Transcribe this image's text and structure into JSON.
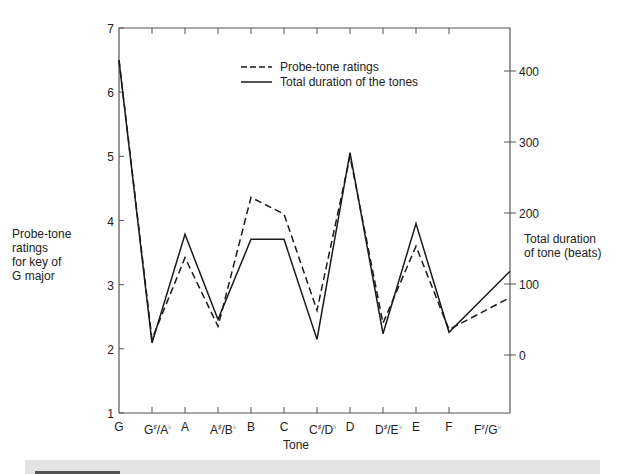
{
  "chart_data": {
    "type": "line",
    "title": "",
    "xlabel": "Tone",
    "ylabel": "Probe-tone ratings for key of G major",
    "y2label": "Total duration of tone (beats)",
    "categories": [
      "G",
      "G♯/A♭",
      "A",
      "A♯/B♭",
      "B",
      "C",
      "C♯/D♭",
      "D",
      "D♯/E♭",
      "E",
      "F",
      "F♯/G♭"
    ],
    "category_display": [
      {
        "base": "G",
        "sup": "",
        "base2": "",
        "sup2": ""
      },
      {
        "base": "G",
        "sup": "♯",
        "base2": "/A",
        "sup2": "♭"
      },
      {
        "base": "A",
        "sup": "",
        "base2": "",
        "sup2": ""
      },
      {
        "base": "A",
        "sup": "♯",
        "base2": "/B",
        "sup2": "♭"
      },
      {
        "base": "B",
        "sup": "",
        "base2": "",
        "sup2": ""
      },
      {
        "base": "C",
        "sup": "",
        "base2": "",
        "sup2": ""
      },
      {
        "base": "C",
        "sup": "♯",
        "base2": "/D",
        "sup2": "♭"
      },
      {
        "base": "D",
        "sup": "",
        "base2": "",
        "sup2": ""
      },
      {
        "base": "D",
        "sup": "♯",
        "base2": "/E",
        "sup2": "♭"
      },
      {
        "base": "E",
        "sup": "",
        "base2": "",
        "sup2": ""
      },
      {
        "base": "F",
        "sup": "",
        "base2": "",
        "sup2": ""
      },
      {
        "base": "F",
        "sup": "♯",
        "base2": "/G",
        "sup2": "♭"
      }
    ],
    "series": [
      {
        "name": "Probe-tone ratings",
        "axis": "left",
        "style": "dashed",
        "values": [
          6.5,
          2.15,
          3.42,
          2.35,
          4.36,
          4.1,
          2.6,
          5.0,
          2.4,
          3.6,
          2.3,
          2.8
        ]
      },
      {
        "name": "Total duration of the tones",
        "axis": "right",
        "style": "solid",
        "values": [
          415,
          17,
          170,
          50,
          163,
          163,
          22,
          285,
          30,
          185,
          32,
          118
        ]
      }
    ],
    "ylim": [
      1,
      7
    ],
    "yticks": [
      1,
      2,
      3,
      4,
      5,
      6,
      7
    ],
    "y2lim": [
      -82,
      460
    ],
    "y2ticks": [
      0,
      100,
      200,
      300,
      400
    ],
    "grid": false,
    "legend_position": "upper center inside"
  },
  "labels": {
    "left_axis": [
      "Probe-tone",
      "ratings",
      "for key of",
      "G major"
    ],
    "right_axis": [
      "Total duration",
      "of tone (beats)"
    ],
    "x_axis": "Tone",
    "legend": [
      "Probe-tone ratings",
      "Total duration of the tones"
    ]
  },
  "colors": {
    "line": "#1a1a1a",
    "axis": "#555555",
    "band": "#e3e3e3"
  }
}
